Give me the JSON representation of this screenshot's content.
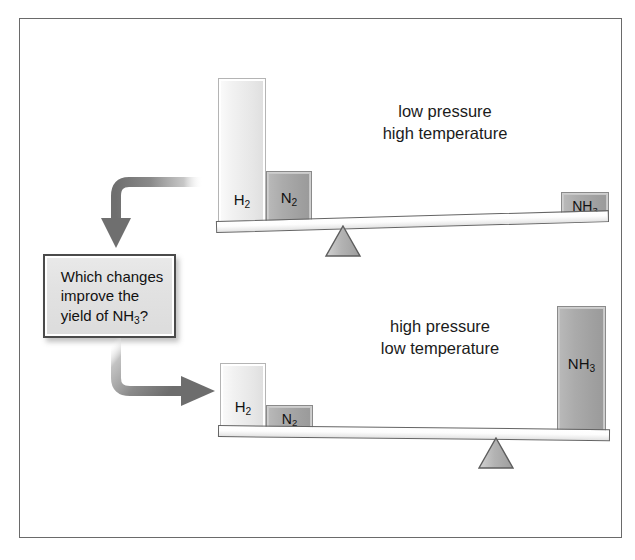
{
  "figure": {
    "border_color": "#6a6a6a",
    "background": "#ffffff"
  },
  "callout": {
    "line1": "Which changes",
    "line2": "improve the",
    "line3_pre": "yield of NH",
    "line3_sub": "3",
    "line3_post": "?",
    "full_text": "Which changes improve the yield of NH3?"
  },
  "arrows": {
    "top": {
      "name": "curved-arrow-down",
      "direction": "down",
      "color": "#777777"
    },
    "bottom": {
      "name": "curved-arrow-right",
      "direction": "right",
      "color": "#777777"
    }
  },
  "scales": [
    {
      "id": "top-scale",
      "conditions": {
        "line1": "low pressure",
        "line2": "high temperature"
      },
      "tilt_degrees": 1.6,
      "tilt_direction": "left-down",
      "fulcrum": {
        "name": "fulcrum-left",
        "x_fraction": 0.28
      },
      "blocks": [
        {
          "id": "h2",
          "formula": "H",
          "sub": "2",
          "label": "H2",
          "shade": "light",
          "relative_height": 1.0
        },
        {
          "id": "n2",
          "formula": "N",
          "sub": "2",
          "label": "N2",
          "shade": "dark",
          "relative_height": 0.35
        },
        {
          "id": "nh3",
          "formula": "NH",
          "sub": "3",
          "label": "NH3",
          "shade": "dark",
          "relative_height": 0.17
        }
      ]
    },
    {
      "id": "bottom-scale",
      "conditions": {
        "line1": "high pressure",
        "line2": "low temperature"
      },
      "tilt_degrees": 0.6,
      "tilt_direction": "right-down",
      "fulcrum": {
        "name": "fulcrum-right",
        "x_fraction": 0.72
      },
      "blocks": [
        {
          "id": "h2",
          "formula": "H",
          "sub": "2",
          "label": "H2",
          "shade": "light",
          "relative_height": 0.47
        },
        {
          "id": "n2",
          "formula": "N",
          "sub": "2",
          "label": "N2",
          "shade": "dark",
          "relative_height": 0.17
        },
        {
          "id": "nh3",
          "formula": "NH",
          "sub": "3",
          "label": "NH3",
          "shade": "dark",
          "relative_height": 0.86
        }
      ]
    }
  ],
  "colors": {
    "block_light": "#ececec",
    "block_dark": "#a5a5a5",
    "beam": "#f2f2f2",
    "outline": "#646464",
    "text": "#111111",
    "arrow": "#777777",
    "callout_fill": "#e2e2e2"
  },
  "chart_data": {
    "type": "bar",
    "xlabel": "",
    "ylabel": "relative amount",
    "categories": [
      "H2",
      "N2",
      "NH3"
    ],
    "series": [
      {
        "name": "low pressure / high temperature",
        "values": [
          1.0,
          0.35,
          0.17
        ]
      },
      {
        "name": "high pressure / low temperature",
        "values": [
          0.47,
          0.17,
          0.86
        ]
      }
    ],
    "ylim": [
      0,
      1.0
    ],
    "grid": false,
    "legend": "none",
    "annotations": [
      "Which changes improve the yield of NH3?"
    ]
  }
}
